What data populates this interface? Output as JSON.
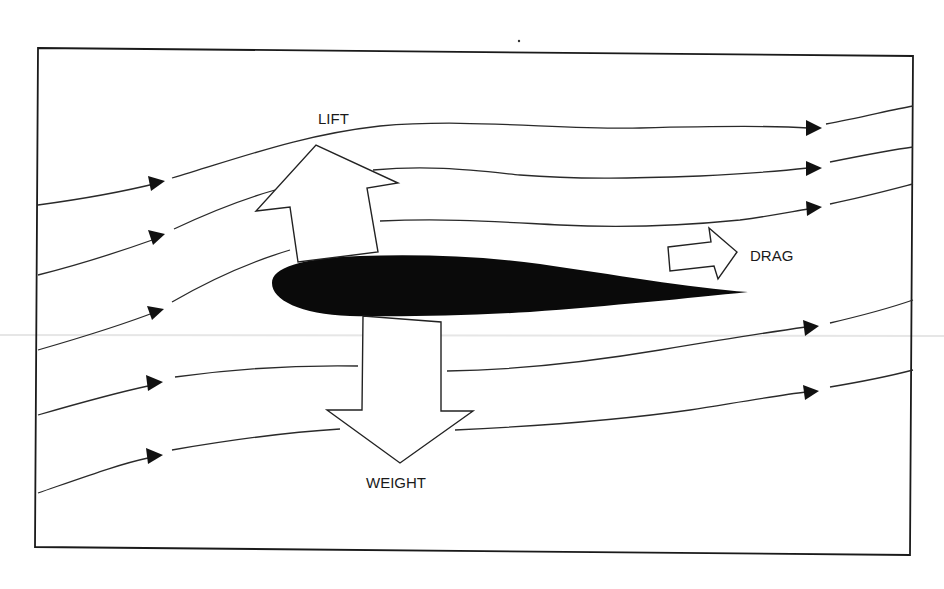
{
  "diagram": {
    "title": "",
    "labels": {
      "lift": "LIFT",
      "drag": "DRAG",
      "weight": "WEIGHT"
    },
    "elements": {
      "airfoil": "airfoil cross-section (solid black)",
      "streamlines_count": 7,
      "force_arrows": [
        "lift (up)",
        "weight (down)",
        "drag (right)"
      ]
    },
    "colors": {
      "background": "#ffffff",
      "ink": "#111111",
      "airfoil": "#0a0a0a",
      "arrow_fill": "#ffffff"
    }
  }
}
